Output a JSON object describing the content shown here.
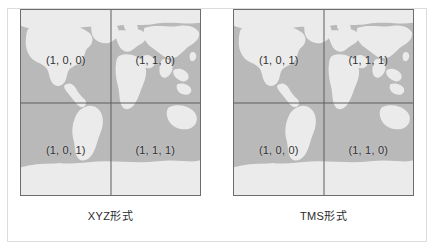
{
  "figure": {
    "panels": [
      {
        "id": "xyz",
        "caption": "XYZ形式",
        "quadrants": [
          {
            "position": "top-left",
            "label": "(1, 0, 0)"
          },
          {
            "position": "top-right",
            "label": "(1, 1, 0)"
          },
          {
            "position": "bottom-left",
            "label": "(1, 0, 1)"
          },
          {
            "position": "bottom-right",
            "label": "(1, 1, 1)"
          }
        ]
      },
      {
        "id": "tms",
        "caption": "TMS形式",
        "quadrants": [
          {
            "position": "top-left",
            "label": "(1, 0, 1)"
          },
          {
            "position": "top-right",
            "label": "(1, 1, 1)"
          },
          {
            "position": "bottom-left",
            "label": "(1, 0, 0)"
          },
          {
            "position": "bottom-right",
            "label": "(1, 1, 0)"
          }
        ]
      }
    ]
  },
  "colors": {
    "ocean": "#b9b9b9",
    "land": "#ebebeb",
    "grid_line": "#5f5f5f",
    "map_border": "#6d6d6d",
    "frame_border": "#dcdcdc",
    "label_text": "#303030",
    "caption_text": "#2b2b2b",
    "background": "#ffffff"
  }
}
